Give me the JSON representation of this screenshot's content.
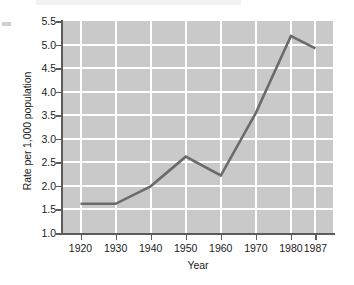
{
  "chart_data": {
    "type": "line",
    "title": "",
    "xlabel": "Year",
    "ylabel": "Rate per 1,000 population",
    "categories": [
      "1920",
      "1930",
      "1940",
      "1950",
      "1960",
      "1970",
      "1980",
      "1987"
    ],
    "x": [
      1920,
      1930,
      1940,
      1950,
      1960,
      1970,
      1980,
      1987
    ],
    "values": [
      1.62,
      1.62,
      1.99,
      2.62,
      2.22,
      3.55,
      5.18,
      4.92
    ],
    "series": [
      {
        "name": "Rate per 1,000 population",
        "values": [
          1.62,
          1.62,
          1.99,
          2.62,
          2.22,
          3.55,
          5.18,
          4.92
        ]
      }
    ],
    "xlim": [
      1915,
      1992
    ],
    "ylim": [
      1.0,
      5.5
    ],
    "ytick_labels": [
      "1.0",
      "1.5",
      "2.0",
      "2.5",
      "3.0",
      "3.5",
      "4.0",
      "4.5",
      "5.0",
      "5.5"
    ],
    "ytick_values": [
      1.0,
      1.5,
      2.0,
      2.5,
      3.0,
      3.5,
      4.0,
      4.5,
      5.0,
      5.5
    ],
    "xtick_labels": [
      "1920",
      "1930",
      "1940",
      "1950",
      "1960",
      "1970",
      "1980",
      "1987"
    ],
    "xtick_values": [
      1920,
      1930,
      1940,
      1950,
      1960,
      1970,
      1980,
      1987
    ],
    "grid": true,
    "legend": false,
    "legend_position": "none",
    "line_color": "#6b6b6b",
    "plot_background_color": "#c9c9c9",
    "gridline_color": "#ffffff",
    "axis_color": "#5c5c5c",
    "text_color": "#1b1b1b"
  }
}
